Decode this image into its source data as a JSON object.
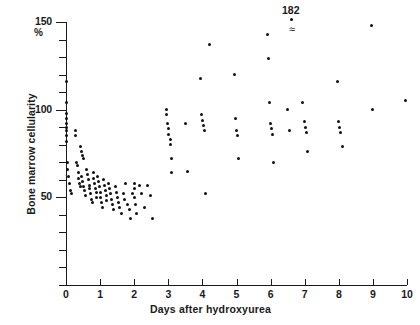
{
  "chart_data": {
    "type": "scatter",
    "title": "",
    "xlabel": "Days after hydroxyurea",
    "ylabel": "Bone marrow cellularity",
    "yunit": "%",
    "xlim": [
      0,
      10
    ],
    "ylim": [
      0,
      150
    ],
    "xticks": [
      0,
      1,
      2,
      3,
      4,
      5,
      6,
      7,
      8,
      9,
      10
    ],
    "xtick_labels": [
      "0",
      "1",
      "2",
      "3",
      "4",
      "5",
      "6",
      "7",
      "8",
      "9",
      "10"
    ],
    "yticks": [
      0,
      10,
      20,
      30,
      40,
      50,
      60,
      70,
      80,
      90,
      100,
      110,
      120,
      130,
      140,
      150
    ],
    "ytick_labels": [
      "",
      "",
      "",
      "",
      "",
      "50",
      "",
      "",
      "",
      "",
      "100",
      "",
      "",
      "",
      "",
      "150"
    ],
    "ylabeled_ticks": [
      50,
      100,
      150
    ],
    "grid": false,
    "legend": null,
    "annotations": [
      {
        "text": "182",
        "x": 7.0,
        "y": 152,
        "note": "off-scale value with axis-break symbol"
      }
    ],
    "points": [
      {
        "x": 0.02,
        "y": 116
      },
      {
        "x": 0.02,
        "y": 104
      },
      {
        "x": 0.02,
        "y": 98
      },
      {
        "x": 0.02,
        "y": 95
      },
      {
        "x": 0.02,
        "y": 92
      },
      {
        "x": 0.02,
        "y": 90
      },
      {
        "x": 0.02,
        "y": 88
      },
      {
        "x": 0.02,
        "y": 85
      },
      {
        "x": 0.02,
        "y": 82
      },
      {
        "x": 0.28,
        "y": 88
      },
      {
        "x": 0.28,
        "y": 85
      },
      {
        "x": 0.42,
        "y": 79
      },
      {
        "x": 0.45,
        "y": 76
      },
      {
        "x": 0.47,
        "y": 74
      },
      {
        "x": 0.5,
        "y": 72
      },
      {
        "x": 0.05,
        "y": 70
      },
      {
        "x": 0.05,
        "y": 66
      },
      {
        "x": 0.08,
        "y": 62
      },
      {
        "x": 0.1,
        "y": 58
      },
      {
        "x": 0.12,
        "y": 54
      },
      {
        "x": 0.15,
        "y": 52
      },
      {
        "x": 0.3,
        "y": 70
      },
      {
        "x": 0.33,
        "y": 68
      },
      {
        "x": 0.36,
        "y": 64
      },
      {
        "x": 0.38,
        "y": 61
      },
      {
        "x": 0.4,
        "y": 58
      },
      {
        "x": 0.42,
        "y": 56
      },
      {
        "x": 0.45,
        "y": 62
      },
      {
        "x": 0.48,
        "y": 59
      },
      {
        "x": 0.52,
        "y": 56
      },
      {
        "x": 0.55,
        "y": 54
      },
      {
        "x": 0.58,
        "y": 51
      },
      {
        "x": 0.6,
        "y": 66
      },
      {
        "x": 0.62,
        "y": 63
      },
      {
        "x": 0.65,
        "y": 60
      },
      {
        "x": 0.68,
        "y": 57
      },
      {
        "x": 0.7,
        "y": 55
      },
      {
        "x": 0.72,
        "y": 52
      },
      {
        "x": 0.75,
        "y": 49
      },
      {
        "x": 0.78,
        "y": 47
      },
      {
        "x": 0.8,
        "y": 64
      },
      {
        "x": 0.82,
        "y": 61
      },
      {
        "x": 0.84,
        "y": 58
      },
      {
        "x": 0.86,
        "y": 55
      },
      {
        "x": 0.88,
        "y": 53
      },
      {
        "x": 0.9,
        "y": 50
      },
      {
        "x": 0.92,
        "y": 62
      },
      {
        "x": 0.95,
        "y": 59
      },
      {
        "x": 0.98,
        "y": 56
      },
      {
        "x": 1.0,
        "y": 53
      },
      {
        "x": 1.02,
        "y": 50
      },
      {
        "x": 1.05,
        "y": 47
      },
      {
        "x": 1.08,
        "y": 44
      },
      {
        "x": 1.1,
        "y": 60
      },
      {
        "x": 1.12,
        "y": 57
      },
      {
        "x": 1.15,
        "y": 54
      },
      {
        "x": 1.18,
        "y": 51
      },
      {
        "x": 1.2,
        "y": 48
      },
      {
        "x": 1.25,
        "y": 58
      },
      {
        "x": 1.28,
        "y": 55
      },
      {
        "x": 1.3,
        "y": 52
      },
      {
        "x": 1.33,
        "y": 49
      },
      {
        "x": 1.36,
        "y": 46
      },
      {
        "x": 1.4,
        "y": 43
      },
      {
        "x": 1.45,
        "y": 56
      },
      {
        "x": 1.48,
        "y": 53
      },
      {
        "x": 1.5,
        "y": 50
      },
      {
        "x": 1.55,
        "y": 47
      },
      {
        "x": 1.58,
        "y": 44
      },
      {
        "x": 1.62,
        "y": 41
      },
      {
        "x": 1.68,
        "y": 52
      },
      {
        "x": 1.72,
        "y": 49
      },
      {
        "x": 1.75,
        "y": 58
      },
      {
        "x": 1.8,
        "y": 46
      },
      {
        "x": 1.85,
        "y": 43
      },
      {
        "x": 1.9,
        "y": 38
      },
      {
        "x": 1.95,
        "y": 52
      },
      {
        "x": 2.0,
        "y": 58
      },
      {
        "x": 2.0,
        "y": 55
      },
      {
        "x": 2.02,
        "y": 50
      },
      {
        "x": 2.05,
        "y": 46
      },
      {
        "x": 2.08,
        "y": 41
      },
      {
        "x": 2.15,
        "y": 57
      },
      {
        "x": 2.2,
        "y": 52
      },
      {
        "x": 2.3,
        "y": 44
      },
      {
        "x": 2.4,
        "y": 57
      },
      {
        "x": 2.48,
        "y": 51
      },
      {
        "x": 2.55,
        "y": 38
      },
      {
        "x": 2.95,
        "y": 100
      },
      {
        "x": 2.95,
        "y": 97
      },
      {
        "x": 2.98,
        "y": 92
      },
      {
        "x": 3.0,
        "y": 89
      },
      {
        "x": 3.02,
        "y": 86
      },
      {
        "x": 3.05,
        "y": 83
      },
      {
        "x": 3.05,
        "y": 80
      },
      {
        "x": 3.08,
        "y": 72
      },
      {
        "x": 3.1,
        "y": 64
      },
      {
        "x": 3.5,
        "y": 92
      },
      {
        "x": 3.55,
        "y": 65
      },
      {
        "x": 3.95,
        "y": 118
      },
      {
        "x": 3.98,
        "y": 97
      },
      {
        "x": 4.0,
        "y": 94
      },
      {
        "x": 4.02,
        "y": 91
      },
      {
        "x": 4.05,
        "y": 88
      },
      {
        "x": 4.08,
        "y": 52
      },
      {
        "x": 4.2,
        "y": 137
      },
      {
        "x": 4.95,
        "y": 120
      },
      {
        "x": 4.98,
        "y": 95
      },
      {
        "x": 5.0,
        "y": 88
      },
      {
        "x": 5.02,
        "y": 85
      },
      {
        "x": 5.05,
        "y": 72
      },
      {
        "x": 5.9,
        "y": 143
      },
      {
        "x": 5.95,
        "y": 129
      },
      {
        "x": 5.98,
        "y": 104
      },
      {
        "x": 6.0,
        "y": 92
      },
      {
        "x": 6.02,
        "y": 89
      },
      {
        "x": 6.05,
        "y": 86
      },
      {
        "x": 6.08,
        "y": 70
      },
      {
        "x": 6.5,
        "y": 100
      },
      {
        "x": 6.55,
        "y": 88
      },
      {
        "x": 6.95,
        "y": 104
      },
      {
        "x": 7.0,
        "y": 93
      },
      {
        "x": 7.02,
        "y": 90
      },
      {
        "x": 7.05,
        "y": 87
      },
      {
        "x": 7.08,
        "y": 76
      },
      {
        "x": 7.95,
        "y": 116
      },
      {
        "x": 8.0,
        "y": 93
      },
      {
        "x": 8.02,
        "y": 90
      },
      {
        "x": 8.05,
        "y": 87
      },
      {
        "x": 8.1,
        "y": 79
      },
      {
        "x": 8.95,
        "y": 148
      },
      {
        "x": 9.0,
        "y": 100
      },
      {
        "x": 9.95,
        "y": 105
      }
    ]
  }
}
